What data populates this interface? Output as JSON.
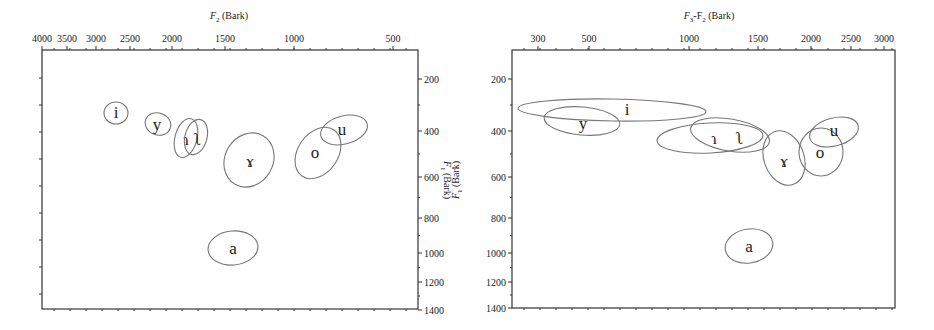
{
  "chart_data": [
    {
      "type": "scatter",
      "subtype": "vowel-ellipse-plot",
      "title": "",
      "xlabel": "F2 (Bark)",
      "ylabel": "F1 (Bark)",
      "x_ticks": [
        "4000",
        "3500",
        "3000",
        "2500",
        "2000",
        "1500",
        "1000",
        "500"
      ],
      "y_ticks": [
        "200",
        "400",
        "600",
        "800",
        "1000",
        "1200",
        "1400"
      ],
      "x_axis_position": "top",
      "y_axis_position": "right",
      "x_reversed": true,
      "y_reversed": true,
      "grid": false,
      "vowels": [
        {
          "label": "i",
          "f2_hz": 2700,
          "f1_hz": 330
        },
        {
          "label": "y",
          "f2_hz": 2200,
          "f1_hz": 370
        },
        {
          "label": "ɿ",
          "f2_hz": 1850,
          "f1_hz": 420
        },
        {
          "label": "ʅ",
          "f2_hz": 1780,
          "f1_hz": 420
        },
        {
          "label": "ɤ",
          "f2_hz": 1250,
          "f1_hz": 520
        },
        {
          "label": "o",
          "f2_hz": 880,
          "f1_hz": 480
        },
        {
          "label": "u",
          "f2_hz": 750,
          "f1_hz": 390
        },
        {
          "label": "a",
          "f2_hz": 1350,
          "f1_hz": 980
        }
      ]
    },
    {
      "type": "scatter",
      "subtype": "vowel-ellipse-plot",
      "title": "",
      "xlabel": "F3-F2 (Bark)",
      "ylabel": "F1 (Bark)",
      "x_ticks": [
        "300",
        "500",
        "1000",
        "1500",
        "2000",
        "2500",
        "3000"
      ],
      "y_ticks": [
        "200",
        "400",
        "600",
        "800",
        "1000",
        "1200",
        "1400"
      ],
      "x_axis_position": "top",
      "y_axis_position": "left",
      "x_reversed": false,
      "y_reversed": true,
      "grid": false,
      "vowels": [
        {
          "label": "i",
          "f3_minus_f2_hz": 800,
          "f1_hz": 310
        },
        {
          "label": "y",
          "f3_minus_f2_hz": 480,
          "f1_hz": 360
        },
        {
          "label": "ɿ",
          "f3_minus_f2_hz": 1150,
          "f1_hz": 440
        },
        {
          "label": "ʅ",
          "f3_minus_f2_hz": 1400,
          "f1_hz": 440
        },
        {
          "label": "ɤ",
          "f3_minus_f2_hz": 1750,
          "f1_hz": 520
        },
        {
          "label": "o",
          "f3_minus_f2_hz": 2150,
          "f1_hz": 480
        },
        {
          "label": "u",
          "f3_minus_f2_hz": 2350,
          "f1_hz": 390
        },
        {
          "label": "a",
          "f3_minus_f2_hz": 1400,
          "f1_hz": 980
        }
      ]
    }
  ],
  "left_panel": {
    "x_title_main": "F",
    "x_title_sub": "2",
    "x_title_rest": " (Bark)",
    "y_title": "F1 (Bark)",
    "x_ticks": [
      {
        "label": "4000",
        "x": 42
      },
      {
        "label": "3500",
        "x": 67
      },
      {
        "label": "3000",
        "x": 96
      },
      {
        "label": "2500",
        "x": 130
      },
      {
        "label": "2000",
        "x": 172
      },
      {
        "label": "1500",
        "x": 225
      },
      {
        "label": "1000",
        "x": 294
      },
      {
        "label": "500",
        "x": 393
      }
    ],
    "y_ticks": [
      {
        "label": "200",
        "y": 79
      },
      {
        "label": "400",
        "y": 131
      },
      {
        "label": "600",
        "y": 177
      },
      {
        "label": "800",
        "y": 218
      },
      {
        "label": "1000",
        "y": 253
      },
      {
        "label": "1200",
        "y": 282
      },
      {
        "label": "1400",
        "y": 310
      }
    ],
    "ellipses": [
      {
        "label": "i",
        "cx": 116,
        "cy": 113,
        "rx": 12,
        "ry": 11,
        "rot": 0,
        "tx": 116,
        "ty": 118
      },
      {
        "label": "y",
        "cx": 158,
        "cy": 124,
        "rx": 13,
        "ry": 11,
        "rot": 20,
        "tx": 157,
        "ty": 130
      },
      {
        "label": "ɿ",
        "cx": 186,
        "cy": 138,
        "rx": 11,
        "ry": 20,
        "rot": 15,
        "tx": 186,
        "ty": 145
      },
      {
        "label": "ʅ",
        "cx": 196,
        "cy": 137,
        "rx": 11,
        "ry": 18,
        "rot": 15,
        "tx": 198,
        "ty": 145
      },
      {
        "label": "ɤ",
        "cx": 249,
        "cy": 160,
        "rx": 24,
        "ry": 28,
        "rot": 30,
        "tx": 250,
        "ty": 167
      },
      {
        "label": "o",
        "cx": 318,
        "cy": 153,
        "rx": 20,
        "ry": 28,
        "rot": 35,
        "tx": 315,
        "ty": 158
      },
      {
        "label": "u",
        "cx": 344,
        "cy": 130,
        "rx": 24,
        "ry": 14,
        "rot": -15,
        "tx": 342,
        "ty": 135
      },
      {
        "label": "a",
        "cx": 233,
        "cy": 248,
        "rx": 25,
        "ry": 17,
        "rot": -5,
        "tx": 233,
        "ty": 254
      }
    ]
  },
  "right_panel": {
    "x_title_main": "F",
    "x_title_sub": "3",
    "x_title_mid": "-F",
    "x_title_sub2": "2",
    "x_title_rest": " (Bark)",
    "y_title": "F1 (Bark)",
    "x_ticks": [
      {
        "label": "300",
        "x": 538
      },
      {
        "label": "500",
        "x": 589
      },
      {
        "label": "1000",
        "x": 689
      },
      {
        "label": "1500",
        "x": 758
      },
      {
        "label": "2000",
        "x": 811
      },
      {
        "label": "2500",
        "x": 851
      },
      {
        "label": "3000",
        "x": 884
      }
    ],
    "y_ticks": [
      {
        "label": "200",
        "y": 79
      },
      {
        "label": "400",
        "y": 131
      },
      {
        "label": "600",
        "y": 177
      },
      {
        "label": "800",
        "y": 218
      },
      {
        "label": "1000",
        "y": 253
      },
      {
        "label": "1200",
        "y": 282
      },
      {
        "label": "1400",
        "y": 308
      }
    ],
    "ellipses": [
      {
        "label": "i",
        "cx": 612,
        "cy": 110,
        "rx": 94,
        "ry": 11,
        "rot": 1,
        "tx": 627,
        "ty": 115
      },
      {
        "label": "y",
        "cx": 582,
        "cy": 121,
        "rx": 38,
        "ry": 14,
        "rot": 5,
        "tx": 583,
        "ty": 129
      },
      {
        "label": "ɿ",
        "cx": 710,
        "cy": 138,
        "rx": 53,
        "ry": 15,
        "rot": -3,
        "tx": 714,
        "ty": 144
      },
      {
        "label": "ʅ",
        "cx": 730,
        "cy": 135,
        "rx": 40,
        "ry": 16,
        "rot": 10,
        "tx": 740,
        "ty": 144
      },
      {
        "label": "ɤ",
        "cx": 784,
        "cy": 158,
        "rx": 20,
        "ry": 28,
        "rot": -20,
        "tx": 784,
        "ty": 167
      },
      {
        "label": "o",
        "cx": 821,
        "cy": 152,
        "rx": 22,
        "ry": 24,
        "rot": 0,
        "tx": 820,
        "ty": 158
      },
      {
        "label": "u",
        "cx": 834,
        "cy": 132,
        "rx": 25,
        "ry": 14,
        "rot": -15,
        "tx": 834,
        "ty": 136
      },
      {
        "label": "a",
        "cx": 749,
        "cy": 246,
        "rx": 24,
        "ry": 17,
        "rot": -10,
        "tx": 749,
        "ty": 252
      }
    ]
  }
}
